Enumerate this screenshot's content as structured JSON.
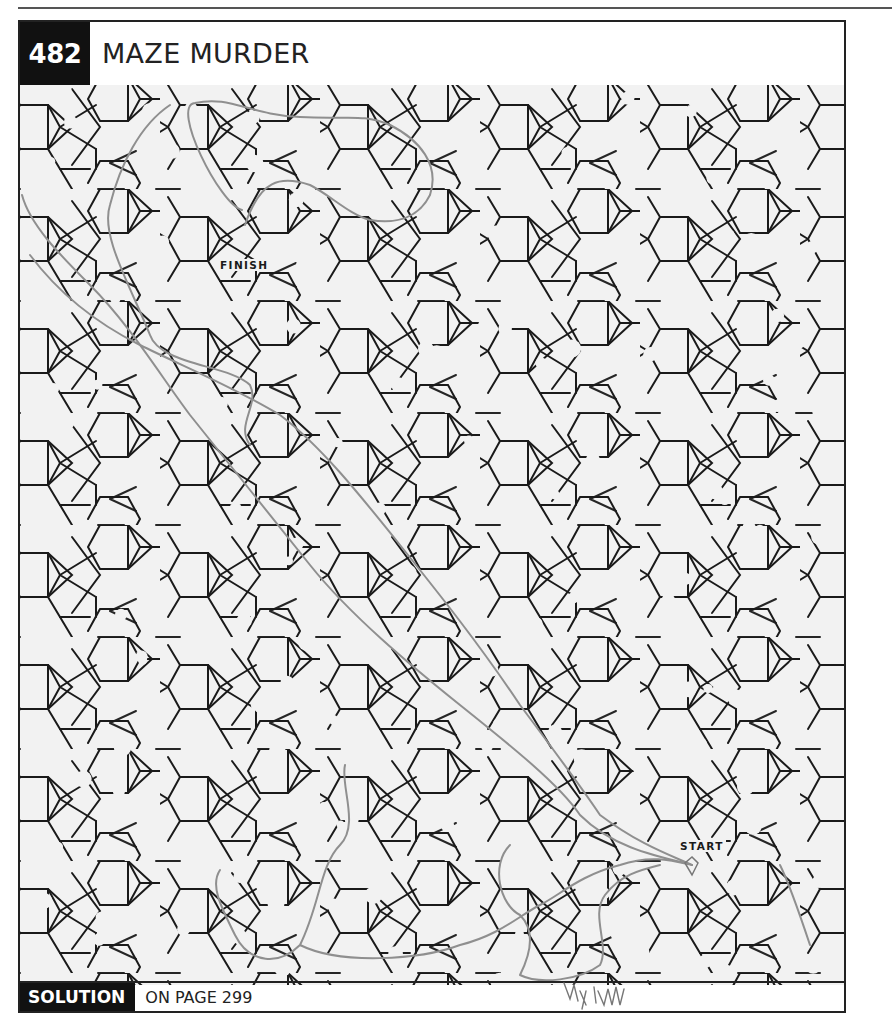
{
  "page": {
    "puzzle_number": "482",
    "puzzle_title": "MAZE MURDER",
    "footer": {
      "solution_label": "SOLUTION",
      "solution_text": "ON PAGE 299"
    }
  },
  "maze": {
    "start_label": "START",
    "finish_label": "FINISH",
    "start_position": {
      "x": 678,
      "y": 842
    },
    "finish_position": {
      "x": 216,
      "y": 263
    },
    "line_color": "#1a1a1a",
    "background_color": "#f2f2f2",
    "pencil_color": "#8a8a8a"
  },
  "annotation": {
    "signature_text": "By Lynn"
  }
}
